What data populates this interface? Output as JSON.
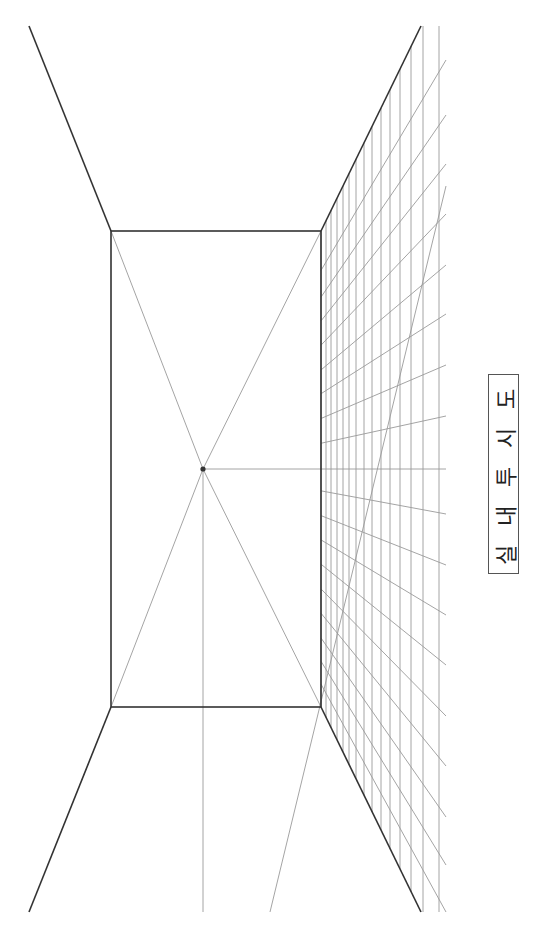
{
  "title": {
    "text": "실 내 투 시 도"
  },
  "colors": {
    "background": "#ffffff",
    "structure_line": "#333333",
    "guide_line": "#9a9a9a",
    "vanishing_point": "#333333"
  },
  "vanishing_point": {
    "x": 203,
    "y": 469
  },
  "back_wall": {
    "left": 111,
    "top": 231,
    "right": 321,
    "bottom": 707
  },
  "room_edges": [
    {
      "name": "ceiling-left-edge",
      "x1": 29,
      "y1": 26,
      "x2": 111,
      "y2": 231
    },
    {
      "name": "ceiling-right-edge",
      "x1": 421,
      "y1": 26,
      "x2": 321,
      "y2": 231
    },
    {
      "name": "floor-left-edge",
      "x1": 29,
      "y1": 912,
      "x2": 111,
      "y2": 707
    },
    {
      "name": "floor-right-edge",
      "x1": 421,
      "y1": 912,
      "x2": 321,
      "y2": 707
    }
  ],
  "guides": [
    {
      "name": "diagonal-top-left",
      "x1": 111,
      "y1": 231,
      "x2": 203,
      "y2": 469
    },
    {
      "name": "diagonal-top-right",
      "x1": 321,
      "y1": 231,
      "x2": 203,
      "y2": 469
    },
    {
      "name": "diagonal-bottom-left",
      "x1": 111,
      "y1": 707,
      "x2": 203,
      "y2": 469
    },
    {
      "name": "diagonal-bottom-right",
      "x1": 321,
      "y1": 707,
      "x2": 203,
      "y2": 469
    },
    {
      "name": "vertical-center-guide",
      "x1": 203,
      "y1": 469,
      "x2": 203,
      "y2": 912
    },
    {
      "name": "long-diagonal-guide",
      "x1": 446,
      "y1": 186,
      "x2": 270,
      "y2": 912
    }
  ],
  "grid": {
    "vertical_x": [
      321,
      326,
      331,
      337,
      343,
      349,
      356,
      364,
      372,
      381,
      390,
      400,
      411,
      423,
      439
    ],
    "ray_end_x": 446,
    "ray_end_y": [
      60,
      115,
      164,
      214,
      265,
      314,
      365,
      416,
      469,
      514,
      565,
      615,
      665,
      716,
      766,
      817,
      865,
      912
    ]
  }
}
